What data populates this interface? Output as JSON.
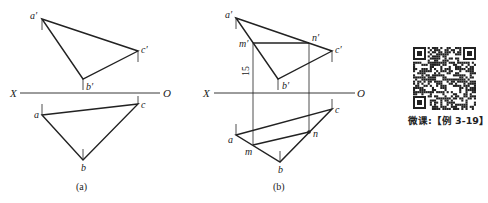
{
  "figure_a": {
    "caption": "(a)",
    "axis": {
      "left_label": "X",
      "right_label": "O"
    },
    "points_front": {
      "a": "a′",
      "b": "b′",
      "c": "c′"
    },
    "points_top": {
      "a": "a",
      "b": "b",
      "c": "c"
    }
  },
  "figure_b": {
    "caption": "(b)",
    "axis": {
      "left_label": "X",
      "right_label": "O"
    },
    "points_front": {
      "a": "a′",
      "b": "b′",
      "c": "c′",
      "m": "m′",
      "n": "n′"
    },
    "points_top": {
      "a": "a",
      "b": "b",
      "c": "c",
      "m": "m",
      "n": "n"
    },
    "dimension": "15"
  },
  "qr": {
    "caption": "微课:【例 3-19】"
  }
}
